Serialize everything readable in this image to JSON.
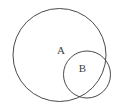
{
  "figure": {
    "kind": "venn-diagram",
    "background_color": "#ffffff",
    "stroke_color": "#4a4a4a",
    "stroke_width": 1,
    "width": 119,
    "height": 110
  },
  "sets": [
    {
      "id": "set-a",
      "label": "A",
      "role": "outer-set",
      "cx": 59.5,
      "cy": 55,
      "r": 46.5,
      "label_x": 61,
      "label_y": 51.5,
      "stroke_color": "#4a4a4a",
      "stroke_width": 1,
      "fill": "none"
    },
    {
      "id": "set-b",
      "label": "B",
      "role": "overlapping-set",
      "cx": 87,
      "cy": 74.5,
      "r": 23.5,
      "label_x": 82.5,
      "label_y": 69.5,
      "stroke_color": "#4a4a4a",
      "stroke_width": 1,
      "fill": "none"
    }
  ],
  "labels": {
    "a": "A",
    "b": "B"
  }
}
